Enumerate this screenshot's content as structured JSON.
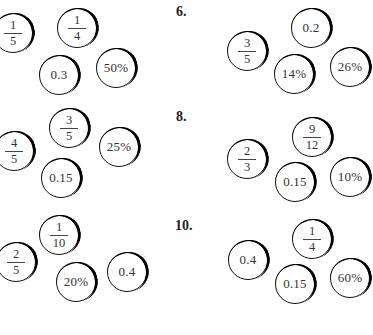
{
  "problems": [
    {
      "number": "",
      "label": "",
      "coins": [
        {
          "type": "fraction",
          "num": "1",
          "den": "5",
          "x": 13,
          "y": 33
        },
        {
          "type": "fraction",
          "num": "1",
          "den": "4",
          "x": 77,
          "y": 28
        },
        {
          "type": "value",
          "text": "0.3",
          "x": 59,
          "y": 75
        },
        {
          "type": "value",
          "text": "50%",
          "x": 116,
          "y": 68
        }
      ]
    },
    {
      "number": "6",
      "label": "6.",
      "label_pos": {
        "x": 176,
        "y": 4
      },
      "coins": [
        {
          "type": "fraction",
          "num": "3",
          "den": "5",
          "x": 247,
          "y": 51
        },
        {
          "type": "value",
          "text": "0.2",
          "x": 311,
          "y": 28
        },
        {
          "type": "value",
          "text": "14%",
          "x": 294,
          "y": 74
        },
        {
          "type": "value",
          "text": "26%",
          "x": 350,
          "y": 67
        }
      ]
    },
    {
      "number": "",
      "label": "",
      "coins": [
        {
          "type": "fraction",
          "num": "4",
          "den": "5",
          "x": 14,
          "y": 151
        },
        {
          "type": "fraction",
          "num": "3",
          "den": "5",
          "x": 69,
          "y": 128
        },
        {
          "type": "value",
          "text": "25%",
          "x": 119,
          "y": 147
        },
        {
          "type": "value",
          "text": "0.15",
          "x": 61,
          "y": 178
        }
      ]
    },
    {
      "number": "8",
      "label": "8.",
      "label_pos": {
        "x": 176,
        "y": 109
      },
      "coins": [
        {
          "type": "fraction",
          "num": "2",
          "den": "3",
          "x": 247,
          "y": 159
        },
        {
          "type": "fraction",
          "num": "9",
          "den": "12",
          "x": 312,
          "y": 137
        },
        {
          "type": "value",
          "text": "0.15",
          "x": 295,
          "y": 182
        },
        {
          "type": "value",
          "text": "10%",
          "x": 350,
          "y": 177
        }
      ]
    },
    {
      "number": "",
      "label": "",
      "coins": [
        {
          "type": "fraction",
          "num": "2",
          "den": "5",
          "x": 16,
          "y": 262
        },
        {
          "type": "fraction",
          "num": "1",
          "den": "10",
          "x": 59,
          "y": 235
        },
        {
          "type": "value",
          "text": "20%",
          "x": 76,
          "y": 282
        },
        {
          "type": "value",
          "text": "0.4",
          "x": 127,
          "y": 272
        }
      ]
    },
    {
      "number": "10",
      "label": "10.",
      "label_pos": {
        "x": 175,
        "y": 218
      },
      "coins": [
        {
          "type": "value",
          "text": "0.4",
          "x": 248,
          "y": 260
        },
        {
          "type": "fraction",
          "num": "1",
          "den": "4",
          "x": 312,
          "y": 239
        },
        {
          "type": "value",
          "text": "0.15",
          "x": 295,
          "y": 284
        },
        {
          "type": "value",
          "text": "60%",
          "x": 350,
          "y": 278
        }
      ]
    }
  ]
}
